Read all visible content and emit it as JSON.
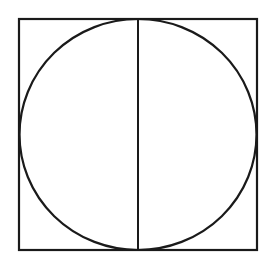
{
  "diagram": {
    "colors": {
      "stroke": "#1a1a1a",
      "background": "#ffffff"
    },
    "square": {
      "x": 19,
      "y": 19,
      "width": 238,
      "height": 231
    },
    "circle": {
      "cx": 138,
      "cy": 134.5,
      "rx": 118.5,
      "ry": 115.5
    },
    "diameter": {
      "x": 138,
      "y1": 19,
      "y2": 250
    }
  }
}
